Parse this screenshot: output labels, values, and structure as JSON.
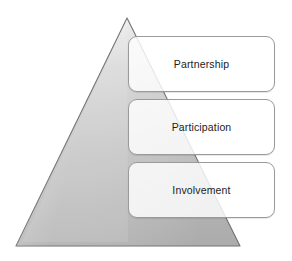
{
  "diagram": {
    "shape": {
      "name": "pyramid-triangle",
      "fill_top_color": "#e8e8e8",
      "fill_bottom_color": "#b4b4b4",
      "stroke_color": "#6f6f6f",
      "apex": {
        "x": 127,
        "y": 18
      },
      "base_left": {
        "x": 16,
        "y": 246
      },
      "base_right": {
        "x": 240,
        "y": 246
      }
    },
    "tiers": [
      {
        "id": "partnership",
        "label": "Partnership",
        "level": 1,
        "box_fill_color": "#ffffff",
        "box_border_color": "#9a9a9a"
      },
      {
        "id": "participation",
        "label": "Participation",
        "level": 2,
        "box_fill_color": "#ffffff",
        "box_border_color": "#9a9a9a"
      },
      {
        "id": "involvement",
        "label": "Involvement",
        "level": 3,
        "box_fill_color": "#ffffff",
        "box_border_color": "#9a9a9a"
      }
    ]
  }
}
